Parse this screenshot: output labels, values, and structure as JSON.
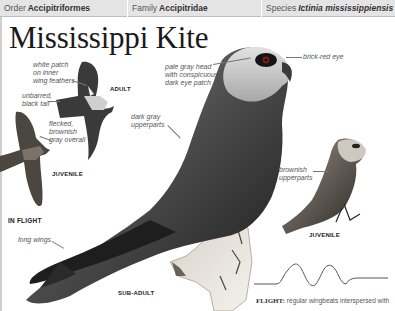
{
  "taxonomy": {
    "order_label": "Order",
    "order_value": "Accipitriformes",
    "family_label": "Family",
    "family_value": "Accipitridae",
    "species_label": "Species",
    "species_value": "Ictinia mississippiensis"
  },
  "title": "Mississippi Kite",
  "annotations": {
    "white_patch": [
      "white patch",
      "on inner",
      "wing feathers"
    ],
    "unbarred_tail": [
      "unbarred,",
      "black tail"
    ],
    "flecked": [
      "flecked,",
      "brownish",
      "gray overall"
    ],
    "pale_head": [
      "pale gray head",
      "with conspicuous",
      "dark eye patch"
    ],
    "brick_eye": "brick-red eye",
    "dark_upperparts": [
      "dark gray",
      "upperparts"
    ],
    "brownish_upperparts": [
      "brownish",
      "upperparts"
    ],
    "long_wings": "long wings"
  },
  "tags": {
    "adult": "ADULT",
    "juvenile_flight": "JUVENILE",
    "in_flight": "IN FLIGHT",
    "juvenile_perched": "JUVENILE",
    "sub_adult": "SUB-ADULT"
  },
  "flight": {
    "label": "FLIGHT:",
    "text": "regular wingbeats interspersed with"
  },
  "colors": {
    "taxbar_bg": "#e4e4e4",
    "title": "#1a1a1a",
    "label_text": "#555555"
  }
}
